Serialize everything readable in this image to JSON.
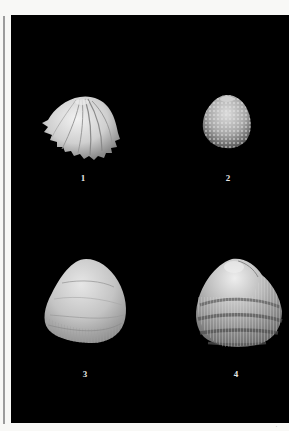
{
  "page": {
    "header_text": "",
    "background": "#f8f8f6",
    "plate_color": "#000000",
    "page_mark": "′"
  },
  "plate": {
    "figures": [
      {
        "number": "1",
        "description": "shell with radiating deep folded ribs and serrated margin"
      },
      {
        "number": "2",
        "description": "small rounded shell with dense spiny/knobbed surface"
      },
      {
        "number": "3",
        "description": "smooth oval clam shell with fine concentric and radial striations"
      },
      {
        "number": "4",
        "description": "rounded cockle shell with concentric dark bands and radial spiny ribs"
      }
    ]
  }
}
